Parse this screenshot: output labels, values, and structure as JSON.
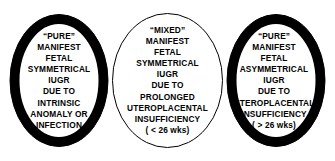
{
  "diagram": {
    "type": "venn",
    "title": "",
    "background_color": "#ffffff",
    "outline_color": "#000000",
    "fill_color": "#ffffff",
    "shadow_color": "#000000",
    "circles": [
      {
        "id": "left",
        "name": "pure-manifest-fetal-symmetrical-iugr",
        "lines": [
          "“PURE”",
          "MANIFEST",
          "FETAL",
          "SYMMETRICAL",
          "IUGR",
          "DUE TO",
          "INTRINSIC",
          "ANOMALY OR",
          "INFECTION"
        ]
      },
      {
        "id": "middle",
        "name": "mixed-manifest-fetal-symmetrical-iugr",
        "lines": [
          "“MIXED”",
          "MANIFEST",
          "FETAL",
          "SYMMETRICAL",
          "IUGR",
          "DUE TO",
          "PROLONGED",
          "UTEROPLACENTAL",
          "INSUFFICIENCY",
          "( < 26 wks)"
        ]
      },
      {
        "id": "right",
        "name": "pure-manifest-fetal-asymmetrical-iugr",
        "lines": [
          "“PURE”",
          "MANIFEST",
          "FETAL",
          "ASYMMETRICAL",
          "IUGR",
          "DUE TO",
          "UTEROPLACENTAL",
          "INSUFFICIENCY",
          "( > 26 wks)"
        ]
      }
    ]
  }
}
